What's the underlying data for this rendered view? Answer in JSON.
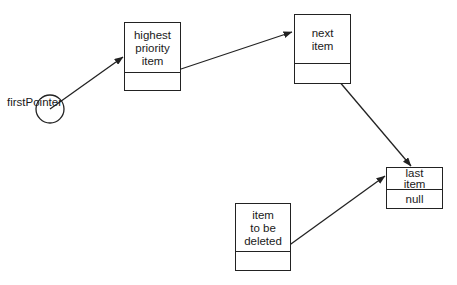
{
  "diagram": {
    "type": "linked-list-priority-queue",
    "pointer_label": "firstPointer",
    "nodes": [
      {
        "id": "highest",
        "lines": [
          "highest",
          "priority",
          "item"
        ],
        "pointer_text": ""
      },
      {
        "id": "next",
        "lines": [
          "next",
          "item"
        ],
        "pointer_text": ""
      },
      {
        "id": "last",
        "lines": [
          "last",
          "item"
        ],
        "pointer_text": "null"
      },
      {
        "id": "deleted",
        "lines": [
          "item",
          "to be",
          "deleted"
        ],
        "pointer_text": ""
      }
    ],
    "edges": [
      {
        "from": "firstPointer",
        "to": "highest"
      },
      {
        "from": "highest",
        "to": "next"
      },
      {
        "from": "next",
        "to": "last"
      },
      {
        "from": "deleted",
        "to": "last"
      }
    ],
    "colors": {
      "stroke": "#222222",
      "background": "#ffffff",
      "text": "#1a1a1a"
    }
  }
}
